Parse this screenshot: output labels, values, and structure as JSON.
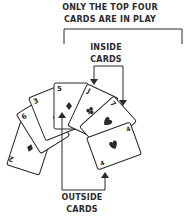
{
  "labels": {
    "top_line1": "ONLY THE TOP FOUR",
    "top_line2": "CARDS ARE IN PLAY",
    "inside_line1": "INSIDE",
    "inside_line2": "CARDS",
    "outside_line1": "OUTSIDE",
    "outside_line2": "CARDS"
  },
  "cards": [
    {
      "rank": "2",
      "suit": "diamond"
    },
    {
      "rank": "6",
      "suit": "club"
    },
    {
      "rank": "3",
      "suit": "club"
    },
    {
      "rank": "5",
      "suit": "diamond"
    },
    {
      "rank": "J",
      "suit": "club"
    },
    {
      "rank": "7",
      "suit": "heart"
    },
    {
      "rank": "4",
      "suit": "heart"
    }
  ],
  "colors": {
    "ink": "#2a2a2a",
    "card_fill": "#ffffff"
  }
}
